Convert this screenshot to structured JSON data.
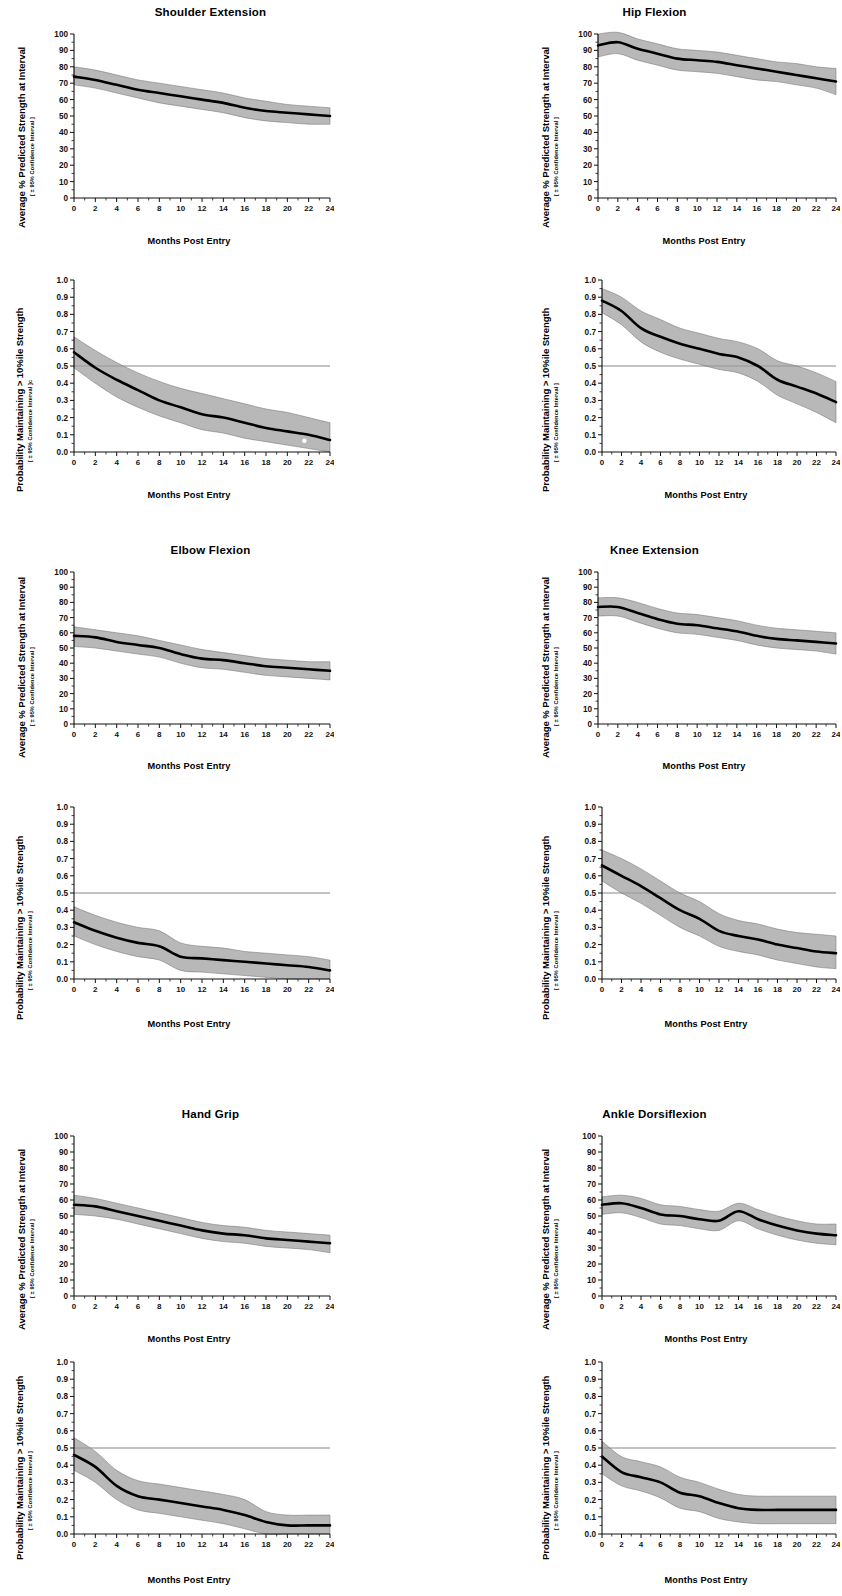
{
  "figure": {
    "axis_labels": {
      "x": "Months Post Entry",
      "y_strength_main": "Average % Predicted Strength at Interval",
      "y_strength_sub": "[ ± 95% Confidence Interval ]",
      "y_prob_main": "Probability Maintaining > 10%ile Strength",
      "y_prob_sub": "[ ± 95% Confidence Interval ]",
      "y_prob_sub_alt": "[ ± 95% Confidence Interval ]c"
    },
    "x_ticks": [
      "0",
      "2",
      "4",
      "6",
      "8",
      "10",
      "12",
      "14",
      "16",
      "18",
      "20",
      "22",
      "24"
    ],
    "y_ticks_strength": [
      "0",
      "10",
      "20",
      "30",
      "40",
      "50",
      "60",
      "70",
      "80",
      "90",
      "100"
    ],
    "y_ticks_prob": [
      "0.0",
      "0.1",
      "0.2",
      "0.3",
      "0.4",
      "0.5",
      "0.6",
      "0.7",
      "0.8",
      "0.9",
      "1.0"
    ],
    "titles": {
      "shoulder_extension": "Shoulder Extension",
      "hip_flexion": "Hip Flexion",
      "elbow_flexion": "Elbow Flexion",
      "knee_extension": "Knee Extension",
      "hand_grip": "Hand Grip",
      "ankle_dorsiflexion": "Ankle Dorsiflexion"
    },
    "colors": {
      "band": "#9d9d9d",
      "mean_line": "#000000",
      "reference_line": "#555555",
      "background": "#ffffff"
    },
    "reference_line_value": 0.5
  },
  "chart_data": [
    {
      "id": "shoulder-extension-strength",
      "type": "line",
      "title": "Shoulder Extension",
      "xlabel": "Months Post Entry",
      "ylabel": "Average % Predicted Strength at Interval [ ± 95% Confidence Interval ]",
      "xlim": [
        0,
        24
      ],
      "ylim": [
        0,
        100
      ],
      "grid": false,
      "legend": "none",
      "x": [
        0,
        2,
        4,
        6,
        8,
        10,
        12,
        14,
        16,
        18,
        20,
        22,
        24
      ],
      "series": [
        {
          "name": "mean",
          "values": [
            74,
            72,
            69,
            66,
            64,
            62,
            60,
            58,
            55,
            53,
            52,
            51,
            50
          ]
        },
        {
          "name": "upper_95",
          "values": [
            80,
            78,
            75,
            72,
            70,
            68,
            66,
            64,
            61,
            59,
            57,
            56,
            55
          ]
        },
        {
          "name": "lower_95",
          "values": [
            69,
            67,
            64,
            61,
            58,
            56,
            54,
            52,
            49,
            47,
            46,
            45,
            45
          ]
        }
      ]
    },
    {
      "id": "shoulder-extension-probability",
      "type": "line",
      "title": "Shoulder Extension",
      "xlabel": "Months Post Entry",
      "ylabel": "Probability Maintaining > 10%ile Strength [ ± 95% Confidence Interval ]c",
      "xlim": [
        0,
        24
      ],
      "ylim": [
        0,
        1
      ],
      "grid": false,
      "legend": "none",
      "reference_line": 0.5,
      "x": [
        0,
        2,
        4,
        6,
        8,
        10,
        12,
        14,
        16,
        18,
        20,
        22,
        24
      ],
      "series": [
        {
          "name": "mean",
          "values": [
            0.58,
            0.49,
            0.42,
            0.36,
            0.3,
            0.26,
            0.22,
            0.2,
            0.17,
            0.14,
            0.12,
            0.1,
            0.07
          ]
        },
        {
          "name": "upper_95",
          "values": [
            0.67,
            0.59,
            0.52,
            0.46,
            0.41,
            0.37,
            0.34,
            0.31,
            0.28,
            0.25,
            0.23,
            0.2,
            0.17
          ]
        },
        {
          "name": "lower_95",
          "values": [
            0.49,
            0.4,
            0.32,
            0.26,
            0.21,
            0.17,
            0.13,
            0.11,
            0.08,
            0.06,
            0.04,
            0.02,
            0.0
          ]
        }
      ]
    },
    {
      "id": "hip-flexion-strength",
      "type": "line",
      "title": "Hip Flexion",
      "xlabel": "Months Post Entry",
      "ylabel": "Average % Predicted Strength at Interval [ ± 95% Confidence Interval ]",
      "xlim": [
        0,
        24
      ],
      "ylim": [
        0,
        100
      ],
      "grid": false,
      "legend": "none",
      "x": [
        0,
        2,
        4,
        6,
        8,
        10,
        12,
        14,
        16,
        18,
        20,
        22,
        24
      ],
      "series": [
        {
          "name": "mean",
          "values": [
            93,
            95,
            91,
            88,
            85,
            84,
            83,
            81,
            79,
            77,
            75,
            73,
            71
          ]
        },
        {
          "name": "upper_95",
          "values": [
            100,
            101,
            97,
            94,
            91,
            90,
            89,
            87,
            85,
            83,
            82,
            80,
            79
          ]
        },
        {
          "name": "lower_95",
          "values": [
            86,
            88,
            84,
            81,
            78,
            77,
            76,
            74,
            72,
            71,
            69,
            67,
            63
          ]
        }
      ]
    },
    {
      "id": "hip-flexion-probability",
      "type": "line",
      "title": "Hip Flexion",
      "xlabel": "Months Post Entry",
      "ylabel": "Probability Maintaining > 10%ile Strength [ ± 95% Confidence Interval ]",
      "xlim": [
        0,
        24
      ],
      "ylim": [
        0,
        1
      ],
      "grid": false,
      "legend": "none",
      "reference_line": 0.5,
      "x": [
        0,
        2,
        4,
        6,
        8,
        10,
        12,
        14,
        16,
        18,
        20,
        22,
        24
      ],
      "series": [
        {
          "name": "mean",
          "values": [
            0.88,
            0.82,
            0.72,
            0.67,
            0.63,
            0.6,
            0.57,
            0.55,
            0.5,
            0.42,
            0.38,
            0.34,
            0.29
          ]
        },
        {
          "name": "upper_95",
          "values": [
            0.95,
            0.9,
            0.82,
            0.77,
            0.72,
            0.69,
            0.66,
            0.64,
            0.6,
            0.53,
            0.5,
            0.46,
            0.41
          ]
        },
        {
          "name": "lower_95",
          "values": [
            0.81,
            0.74,
            0.64,
            0.58,
            0.54,
            0.51,
            0.48,
            0.46,
            0.41,
            0.33,
            0.28,
            0.23,
            0.17
          ]
        }
      ]
    },
    {
      "id": "elbow-flexion-strength",
      "type": "line",
      "title": "Elbow Flexion",
      "xlabel": "Months Post Entry",
      "ylabel": "Average % Predicted Strength at Interval [ ± 95% Confidence Interval ]",
      "xlim": [
        0,
        24
      ],
      "ylim": [
        0,
        100
      ],
      "grid": false,
      "legend": "none",
      "x": [
        0,
        2,
        4,
        6,
        8,
        10,
        12,
        14,
        16,
        18,
        20,
        22,
        24
      ],
      "series": [
        {
          "name": "mean",
          "values": [
            58,
            57,
            54,
            52,
            50,
            46,
            43,
            42,
            40,
            38,
            37,
            36,
            35
          ]
        },
        {
          "name": "upper_95",
          "values": [
            64,
            62,
            60,
            58,
            55,
            52,
            49,
            47,
            45,
            43,
            42,
            41,
            41
          ]
        },
        {
          "name": "lower_95",
          "values": [
            51,
            50,
            48,
            46,
            44,
            40,
            37,
            36,
            34,
            32,
            31,
            30,
            29
          ]
        }
      ]
    },
    {
      "id": "elbow-flexion-probability",
      "type": "line",
      "title": "Elbow Flexion",
      "xlabel": "Months Post Entry",
      "ylabel": "Probability Maintaining > 10%ile Strength [ ± 95% Confidence Interval ]",
      "xlim": [
        0,
        24
      ],
      "ylim": [
        0,
        1
      ],
      "grid": false,
      "legend": "none",
      "reference_line": 0.5,
      "x": [
        0,
        2,
        4,
        6,
        8,
        10,
        12,
        14,
        16,
        18,
        20,
        22,
        24
      ],
      "series": [
        {
          "name": "mean",
          "values": [
            0.33,
            0.28,
            0.24,
            0.21,
            0.19,
            0.13,
            0.12,
            0.11,
            0.1,
            0.09,
            0.08,
            0.07,
            0.05
          ]
        },
        {
          "name": "upper_95",
          "values": [
            0.42,
            0.37,
            0.33,
            0.3,
            0.28,
            0.21,
            0.19,
            0.18,
            0.16,
            0.15,
            0.14,
            0.13,
            0.11
          ]
        },
        {
          "name": "lower_95",
          "values": [
            0.25,
            0.2,
            0.16,
            0.13,
            0.11,
            0.05,
            0.04,
            0.03,
            0.02,
            0.01,
            0.0,
            0.0,
            0.0
          ]
        }
      ]
    },
    {
      "id": "knee-extension-strength",
      "type": "line",
      "title": "Knee Extension",
      "xlabel": "Months Post Entry",
      "ylabel": "Average % Predicted Strength at Interval [ ± 95% Confidence Interval ]",
      "xlim": [
        0,
        24
      ],
      "ylim": [
        0,
        100
      ],
      "grid": false,
      "legend": "none",
      "x": [
        0,
        2,
        4,
        6,
        8,
        10,
        12,
        14,
        16,
        18,
        20,
        22,
        24
      ],
      "series": [
        {
          "name": "mean",
          "values": [
            77,
            77,
            73,
            69,
            66,
            65,
            63,
            61,
            58,
            56,
            55,
            54,
            53
          ]
        },
        {
          "name": "upper_95",
          "values": [
            83,
            83,
            80,
            76,
            73,
            72,
            70,
            68,
            65,
            63,
            62,
            61,
            60
          ]
        },
        {
          "name": "lower_95",
          "values": [
            71,
            71,
            67,
            63,
            60,
            59,
            57,
            55,
            52,
            50,
            49,
            48,
            46
          ]
        }
      ]
    },
    {
      "id": "knee-extension-probability",
      "type": "line",
      "title": "Knee Extension",
      "xlabel": "Months Post Entry",
      "ylabel": "Probability Maintaining > 10%ile Strength [ ± 95% Confidence Interval ]",
      "xlim": [
        0,
        24
      ],
      "ylim": [
        0,
        1
      ],
      "grid": false,
      "legend": "none",
      "reference_line": 0.5,
      "x": [
        0,
        2,
        4,
        6,
        8,
        10,
        12,
        14,
        16,
        18,
        20,
        22,
        24
      ],
      "series": [
        {
          "name": "mean",
          "values": [
            0.66,
            0.6,
            0.54,
            0.47,
            0.4,
            0.35,
            0.28,
            0.25,
            0.23,
            0.2,
            0.18,
            0.16,
            0.15
          ]
        },
        {
          "name": "upper_95",
          "values": [
            0.75,
            0.7,
            0.64,
            0.57,
            0.5,
            0.45,
            0.38,
            0.34,
            0.32,
            0.29,
            0.27,
            0.26,
            0.25
          ]
        },
        {
          "name": "lower_95",
          "values": [
            0.57,
            0.5,
            0.44,
            0.37,
            0.3,
            0.25,
            0.19,
            0.16,
            0.14,
            0.11,
            0.09,
            0.07,
            0.06
          ]
        }
      ]
    },
    {
      "id": "hand-grip-strength",
      "type": "line",
      "title": "Hand Grip",
      "xlabel": "Months Post Entry",
      "ylabel": "Average % Predicted Strength at Interval [ ± 95% Confidence Interval ]",
      "xlim": [
        0,
        24
      ],
      "ylim": [
        0,
        100
      ],
      "grid": false,
      "legend": "none",
      "x": [
        0,
        2,
        4,
        6,
        8,
        10,
        12,
        14,
        16,
        18,
        20,
        22,
        24
      ],
      "series": [
        {
          "name": "mean",
          "values": [
            57,
            56,
            53,
            50,
            47,
            44,
            41,
            39,
            38,
            36,
            35,
            34,
            33
          ]
        },
        {
          "name": "upper_95",
          "values": [
            63,
            61,
            58,
            55,
            52,
            49,
            46,
            44,
            43,
            41,
            40,
            39,
            38
          ]
        },
        {
          "name": "lower_95",
          "values": [
            51,
            50,
            48,
            45,
            42,
            39,
            36,
            34,
            33,
            31,
            30,
            29,
            27
          ]
        }
      ]
    },
    {
      "id": "hand-grip-probability",
      "type": "line",
      "title": "Hand Grip",
      "xlabel": "Months Post Entry",
      "ylabel": "Probability Maintaining > 10%ile Strength [ ± 95% Confidence Interval ]",
      "xlim": [
        0,
        24
      ],
      "ylim": [
        0,
        1
      ],
      "grid": false,
      "legend": "none",
      "reference_line": 0.5,
      "x": [
        0,
        2,
        4,
        6,
        8,
        10,
        12,
        14,
        16,
        18,
        20,
        22,
        24
      ],
      "series": [
        {
          "name": "mean",
          "values": [
            0.46,
            0.39,
            0.28,
            0.22,
            0.2,
            0.18,
            0.16,
            0.14,
            0.11,
            0.07,
            0.05,
            0.05,
            0.05
          ]
        },
        {
          "name": "upper_95",
          "values": [
            0.56,
            0.48,
            0.37,
            0.31,
            0.29,
            0.27,
            0.25,
            0.23,
            0.2,
            0.13,
            0.11,
            0.11,
            0.11
          ]
        },
        {
          "name": "lower_95",
          "values": [
            0.37,
            0.3,
            0.2,
            0.14,
            0.12,
            0.1,
            0.08,
            0.06,
            0.03,
            0.0,
            0.0,
            0.0,
            0.0
          ]
        }
      ]
    },
    {
      "id": "ankle-dorsiflexion-strength",
      "type": "line",
      "title": "Ankle Dorsiflexion",
      "xlabel": "Months Post Entry",
      "ylabel": "Average % Predicted Strength at Interval [ ± 95% Confidence Interval ]",
      "xlim": [
        0,
        24
      ],
      "ylim": [
        0,
        100
      ],
      "grid": false,
      "legend": "none",
      "x": [
        0,
        2,
        4,
        6,
        8,
        10,
        12,
        14,
        16,
        18,
        20,
        22,
        24
      ],
      "series": [
        {
          "name": "mean",
          "values": [
            57,
            58,
            55,
            51,
            50,
            48,
            47,
            53,
            48,
            44,
            41,
            39,
            38
          ]
        },
        {
          "name": "upper_95",
          "values": [
            62,
            63,
            61,
            57,
            56,
            54,
            53,
            58,
            54,
            50,
            47,
            45,
            45
          ]
        },
        {
          "name": "lower_95",
          "values": [
            51,
            52,
            49,
            45,
            44,
            42,
            41,
            47,
            42,
            38,
            35,
            33,
            32
          ]
        }
      ]
    },
    {
      "id": "ankle-dorsiflexion-probability",
      "type": "line",
      "title": "Ankle Dorsiflexion",
      "xlabel": "Months Post Entry",
      "ylabel": "Probability Maintaining > 10%ile Strength [ ± 95% Confidence Interval ]",
      "xlim": [
        0,
        24
      ],
      "ylim": [
        0,
        1
      ],
      "grid": false,
      "legend": "none",
      "reference_line": 0.5,
      "x": [
        0,
        2,
        4,
        6,
        8,
        10,
        12,
        14,
        16,
        18,
        20,
        22,
        24
      ],
      "series": [
        {
          "name": "mean",
          "values": [
            0.45,
            0.36,
            0.33,
            0.3,
            0.24,
            0.22,
            0.18,
            0.15,
            0.14,
            0.14,
            0.14,
            0.14,
            0.14
          ]
        },
        {
          "name": "upper_95",
          "values": [
            0.54,
            0.45,
            0.42,
            0.39,
            0.33,
            0.3,
            0.26,
            0.23,
            0.22,
            0.22,
            0.22,
            0.22,
            0.22
          ]
        },
        {
          "name": "lower_95",
          "values": [
            0.35,
            0.28,
            0.25,
            0.21,
            0.15,
            0.13,
            0.09,
            0.07,
            0.06,
            0.06,
            0.06,
            0.06,
            0.06
          ]
        }
      ]
    }
  ]
}
